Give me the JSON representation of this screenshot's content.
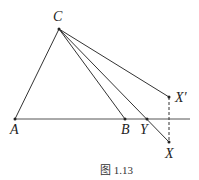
{
  "figure": {
    "caption": "图 1.13",
    "points": {
      "C": {
        "label": "C",
        "x": 59,
        "y": 29
      },
      "A": {
        "label": "A",
        "x": 15,
        "y": 119
      },
      "B": {
        "label": "B",
        "x": 125,
        "y": 119
      },
      "Y": {
        "label": "Y",
        "x": 147,
        "y": 119
      },
      "Xp": {
        "label": "X′",
        "x": 169,
        "y": 97
      },
      "X": {
        "label": "X",
        "x": 169,
        "y": 142
      }
    },
    "segments": [
      "CA",
      "AB (extended line)",
      "CB",
      "CX",
      "CX′",
      "X′X (dashed)"
    ]
  }
}
